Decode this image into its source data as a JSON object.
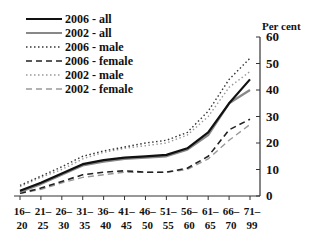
{
  "chart_data": {
    "type": "line",
    "title": "",
    "xlabel": "",
    "ylabel": "Per cent",
    "ylim": [
      0,
      60
    ],
    "yticks": [
      0,
      10,
      20,
      30,
      40,
      50,
      60
    ],
    "grid": false,
    "legend_position": "top-left",
    "categories": [
      "16–20",
      "21–25",
      "26–30",
      "31–35",
      "36–40",
      "41–45",
      "46–50",
      "51–55",
      "56–60",
      "61–65",
      "66–70",
      "71–99"
    ],
    "category_lines": [
      [
        "16–",
        "20"
      ],
      [
        "21–",
        "25"
      ],
      [
        "26–",
        "30"
      ],
      [
        "31–",
        "35"
      ],
      [
        "36–",
        "40"
      ],
      [
        "41–",
        "45"
      ],
      [
        "46–",
        "50"
      ],
      [
        "51–",
        "55"
      ],
      [
        "56–",
        "60"
      ],
      [
        "61–",
        "65"
      ],
      [
        "66–",
        "70"
      ],
      [
        "71–",
        "99"
      ]
    ],
    "series": [
      {
        "name": "2006 - all",
        "style": "solid",
        "color": "#111111",
        "width": 2.2,
        "values": [
          2,
          5,
          8.5,
          12,
          13.5,
          14.5,
          15,
          15.5,
          18,
          24,
          35,
          44
        ]
      },
      {
        "name": "2002 - all",
        "style": "solid",
        "color": "#888888",
        "width": 2.2,
        "values": [
          1.5,
          4.5,
          8,
          11.5,
          13,
          14,
          14.5,
          15,
          17.5,
          23,
          35,
          40
        ]
      },
      {
        "name": "2006 - male",
        "style": "dotted",
        "color": "#333333",
        "width": 1.4,
        "values": [
          4,
          7.5,
          11,
          15,
          17,
          18.5,
          20,
          21,
          24,
          32,
          44,
          52
        ]
      },
      {
        "name": "2006 - female",
        "style": "dashed",
        "color": "#222222",
        "width": 1.6,
        "values": [
          1,
          3,
          5.5,
          8,
          9,
          9.5,
          9,
          9,
          10.5,
          15,
          25,
          29
        ]
      },
      {
        "name": "2002 - male",
        "style": "dotted",
        "color": "#999999",
        "width": 1.4,
        "values": [
          3.5,
          7,
          10,
          14,
          16.5,
          18,
          19,
          20,
          23,
          30,
          41,
          47
        ]
      },
      {
        "name": "2002 - female",
        "style": "dashed",
        "color": "#999999",
        "width": 1.4,
        "values": [
          1,
          2.5,
          5,
          7,
          8,
          9,
          9,
          9,
          10,
          14,
          21,
          27
        ]
      }
    ]
  }
}
